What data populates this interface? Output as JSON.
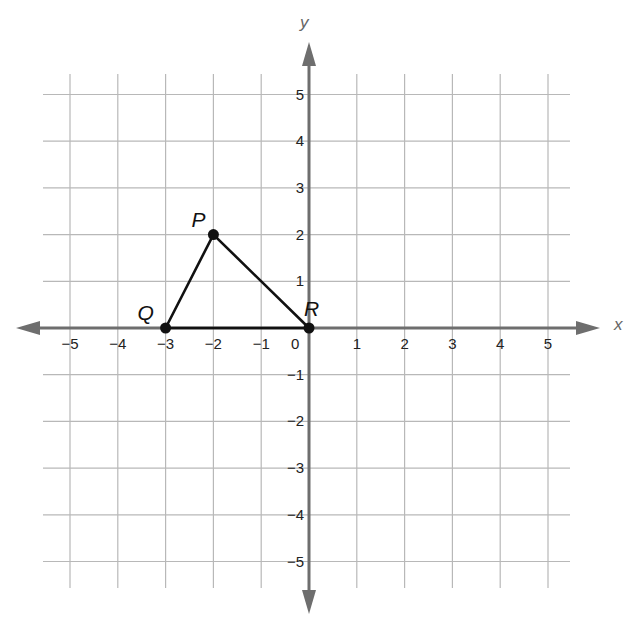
{
  "title_fragment": "",
  "axes": {
    "x_label": "x",
    "y_label": "y",
    "x_ticks": [
      {
        "value": -5,
        "label": "−5"
      },
      {
        "value": -4,
        "label": "−4"
      },
      {
        "value": -3,
        "label": "−3"
      },
      {
        "value": -2,
        "label": "−2"
      },
      {
        "value": -1,
        "label": "−1"
      },
      {
        "value": 1,
        "label": "1"
      },
      {
        "value": 2,
        "label": "2"
      },
      {
        "value": 3,
        "label": "3"
      },
      {
        "value": 4,
        "label": "4"
      },
      {
        "value": 5,
        "label": "5"
      }
    ],
    "y_ticks": [
      {
        "value": 5,
        "label": "5"
      },
      {
        "value": 4,
        "label": "4"
      },
      {
        "value": 3,
        "label": "3"
      },
      {
        "value": 2,
        "label": "2"
      },
      {
        "value": 1,
        "label": "1"
      },
      {
        "value": -1,
        "label": "−1"
      },
      {
        "value": -2,
        "label": "−2"
      },
      {
        "value": -3,
        "label": "−3"
      },
      {
        "value": -4,
        "label": "−4"
      },
      {
        "value": -5,
        "label": "−5"
      }
    ],
    "origin_label": "0",
    "range": {
      "x": [
        -5,
        5
      ],
      "y": [
        -5,
        5
      ]
    }
  },
  "triangle": {
    "vertices": [
      {
        "name": "P",
        "x": -2,
        "y": 2
      },
      {
        "name": "Q",
        "x": -3,
        "y": 0
      },
      {
        "name": "R",
        "x": 0,
        "y": 0
      }
    ],
    "edges": [
      [
        "P",
        "Q"
      ],
      [
        "Q",
        "R"
      ],
      [
        "R",
        "P"
      ]
    ]
  },
  "colors": {
    "grid": "#b8b8b8",
    "axis": "#6e6e6e",
    "triangle": "#111111",
    "text": "#222222"
  }
}
